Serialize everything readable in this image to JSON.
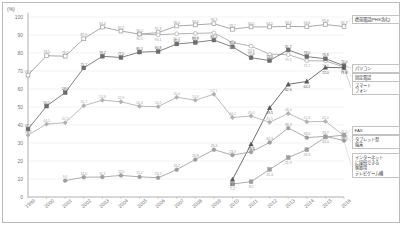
{
  "chart_data": {
    "type": "line",
    "title": "",
    "xlabel": "",
    "ylabel": "(%)",
    "ylim": [
      0,
      100
    ],
    "ytick_step": 10,
    "grid": true,
    "legend_position": "right",
    "yticks": [
      "0",
      "10",
      "20",
      "30",
      "40",
      "50",
      "60",
      "70",
      "80",
      "90",
      "100"
    ],
    "categories": [
      "1999",
      "2000",
      "2001",
      "2002",
      "2003",
      "2004",
      "2005",
      "2006",
      "2007",
      "2008",
      "2009",
      "2010",
      "2011",
      "2012",
      "2013",
      "2014",
      "2015",
      "2016"
    ],
    "series": [
      {
        "name": "携帯電話(PHS含む)",
        "short": "mobile-phone",
        "color": "#9a9a9a",
        "marker": "open-square",
        "values": [
          67.7,
          78.5,
          78.2,
          87.9,
          94.4,
          92.2,
          90.5,
          91.3,
          95.0,
          95.6,
          96.3,
          93.2,
          94.5,
          94.5,
          94.8,
          94.6,
          95.8,
          94.7
        ],
        "labels": [
          "67.7",
          "78.5",
          "78.2",
          "87.9",
          "94.4",
          "92.2",
          "90.5",
          "91.3",
          "95.0",
          "95.6",
          "96.3",
          "93.2",
          "94.5",
          "94.5",
          "94.8",
          "94.6",
          "95.8",
          "94.7"
        ]
      },
      {
        "name": "固定電話",
        "short": "landline-phone",
        "color": "#a8a8a8",
        "marker": "open-circle",
        "values": [
          null,
          null,
          null,
          null,
          null,
          null,
          90.5,
          90.1,
          90.7,
          90.9,
          91.2,
          85.8,
          83.8,
          79.3,
          79.1,
          75.7,
          75.6,
          72.2
        ],
        "labels": [
          "",
          "",
          "",
          "",
          "",
          "",
          "90.5",
          "90.1",
          "90.7",
          "90.9",
          "91.2",
          "85.8",
          "83.8",
          "79.3",
          "79.1",
          "75.7",
          "75.6",
          "72.2"
        ]
      },
      {
        "name": "パソコン",
        "short": "personal-computer",
        "color": "#6b6b6b",
        "marker": "filled-square",
        "values": [
          37.7,
          50.5,
          58.0,
          71.7,
          78.2,
          77.5,
          80.5,
          80.8,
          85.0,
          85.9,
          87.2,
          83.4,
          77.4,
          75.8,
          81.7,
          78.0,
          76.8,
          73.0
        ],
        "labels": [
          "37.7",
          "50.5",
          "58.0",
          "71.7",
          "78.2",
          "77.5",
          "80.5",
          "80.8",
          "85.0",
          "85.9",
          "87.2",
          "83.4",
          "77.4",
          "75.8",
          "81.7",
          "78.0",
          "76.8",
          "73.0"
        ]
      },
      {
        "name": "スマートフォン",
        "short": "smartphone",
        "color": "#555555",
        "marker": "filled-triangle",
        "values": [
          null,
          null,
          null,
          null,
          null,
          null,
          null,
          null,
          null,
          null,
          null,
          9.7,
          29.3,
          49.5,
          62.6,
          64.2,
          72.0,
          71.8
        ],
        "labels": [
          "",
          "",
          "",
          "",
          "",
          "",
          "",
          "",
          "",
          "",
          "",
          "9.7",
          "29.3",
          "49.5",
          "62.6",
          "64.2",
          "72.0",
          "71.8"
        ]
      },
      {
        "name": "FAX",
        "short": "fax",
        "color": "#b0b0b0",
        "marker": "filled-diamond",
        "values": [
          34.4,
          40.5,
          41.3,
          50.7,
          53.8,
          52.9,
          50.4,
          50.2,
          55.4,
          53.8,
          57.1,
          44.2,
          45.0,
          41.5,
          46.4,
          41.8,
          42.0,
          34.1
        ],
        "labels": [
          "34.4",
          "40.5",
          "41.3",
          "50.7",
          "53.8",
          "52.9",
          "50.4",
          "50.2",
          "55.4",
          "53.8",
          "57.1",
          "44.2",
          "45.0",
          "41.5",
          "46.4",
          "41.8",
          "42.0",
          "34.1"
        ]
      },
      {
        "name": "タブレット型端末",
        "short": "tablet",
        "color": "#9e9e9e",
        "marker": "filled-square",
        "values": [
          null,
          null,
          null,
          null,
          null,
          null,
          null,
          null,
          null,
          null,
          null,
          7.2,
          8.5,
          15.3,
          21.9,
          26.3,
          33.3,
          34.4
        ],
        "labels": [
          "",
          "",
          "",
          "",
          "",
          "",
          "",
          "",
          "",
          "",
          "",
          "7.2",
          "8.5",
          "15.3",
          "21.9",
          "26.3",
          "33.3",
          "34.4"
        ]
      },
      {
        "name": "インターネットに接続できる家庭用テレビゲーム機",
        "short": "game-console",
        "color": "#9e9e9e",
        "marker": "filled-circle",
        "values": [
          null,
          null,
          9.1,
          11.0,
          11.1,
          12.0,
          11.2,
          10.7,
          15.2,
          20.8,
          26.3,
          23.3,
          25.0,
          30.3,
          38.3,
          33.0,
          33.7,
          31.4
        ],
        "labels": [
          "",
          "",
          "9.1",
          "11.0",
          "11.1",
          "12.0",
          "11.2",
          "10.7",
          "15.2",
          "20.8",
          "26.3",
          "23.3",
          "25.0",
          "30.3",
          "38.3",
          "33.0",
          "33.7",
          "31.4"
        ]
      }
    ],
    "legend_groups": [
      {
        "text": "携帯電話(PHS含む)",
        "series": "mobile-phone"
      },
      {
        "text": "パソコン",
        "series": "personal-computer"
      },
      {
        "text": "固定電話",
        "series": "landline-phone"
      },
      {
        "text": "スマート\nフォン",
        "series": "smartphone"
      },
      {
        "text": "FAX",
        "series": "fax"
      },
      {
        "text": "タブレット型\n端末",
        "series": "tablet"
      },
      {
        "text": "インターネット\nに接続できる\n家庭用\nテレビゲーム機",
        "series": "game-console"
      }
    ]
  }
}
